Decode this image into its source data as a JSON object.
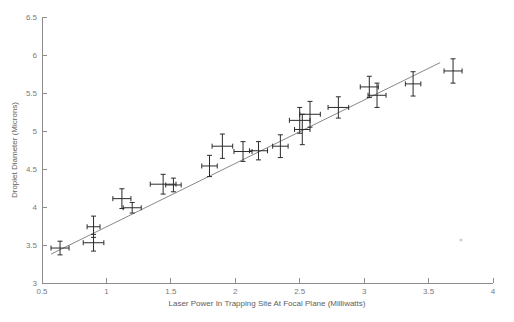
{
  "chart_data": {
    "type": "scatter",
    "title": "",
    "xlabel": "Laser Power In Trapping Site At Focal Plane (Milliwatts)",
    "ylabel": "Droplet Diameter (Microns)",
    "xlim": [
      0.5,
      4.0
    ],
    "ylim": [
      3.0,
      6.5
    ],
    "xticks": [
      0.5,
      1,
      1.5,
      2,
      2.5,
      3,
      3.5,
      4
    ],
    "yticks": [
      3,
      3.5,
      4,
      4.5,
      5,
      5.5,
      6,
      6.5
    ],
    "xtick_labels": [
      "0.5",
      "1",
      "1.5",
      "2",
      "2.5",
      "3",
      "3.5",
      "4"
    ],
    "ytick_labels": [
      "3",
      "3.5",
      "4",
      "4.5",
      "5",
      "5.5",
      "6",
      "6.5"
    ],
    "grid": false,
    "legend": false,
    "error_bars": "both",
    "points": [
      {
        "x": 0.64,
        "y": 3.46,
        "xerr": 0.07,
        "yerr": 0.09
      },
      {
        "x": 0.9,
        "y": 3.74,
        "xerr": 0.05,
        "yerr": 0.14
      },
      {
        "x": 0.9,
        "y": 3.53,
        "xerr": 0.08,
        "yerr": 0.11
      },
      {
        "x": 1.12,
        "y": 4.11,
        "xerr": 0.07,
        "yerr": 0.13
      },
      {
        "x": 1.2,
        "y": 3.99,
        "xerr": 0.07,
        "yerr": 0.07
      },
      {
        "x": 1.44,
        "y": 4.3,
        "xerr": 0.1,
        "yerr": 0.13
      },
      {
        "x": 1.52,
        "y": 4.29,
        "xerr": 0.06,
        "yerr": 0.09
      },
      {
        "x": 1.8,
        "y": 4.54,
        "xerr": 0.06,
        "yerr": 0.14
      },
      {
        "x": 1.9,
        "y": 4.8,
        "xerr": 0.08,
        "yerr": 0.16
      },
      {
        "x": 2.06,
        "y": 4.73,
        "xerr": 0.07,
        "yerr": 0.13
      },
      {
        "x": 2.18,
        "y": 4.74,
        "xerr": 0.07,
        "yerr": 0.12
      },
      {
        "x": 2.35,
        "y": 4.8,
        "xerr": 0.06,
        "yerr": 0.15
      },
      {
        "x": 2.5,
        "y": 5.14,
        "xerr": 0.08,
        "yerr": 0.17
      },
      {
        "x": 2.52,
        "y": 5.02,
        "xerr": 0.06,
        "yerr": 0.2
      },
      {
        "x": 2.58,
        "y": 5.22,
        "xerr": 0.08,
        "yerr": 0.17
      },
      {
        "x": 2.8,
        "y": 5.31,
        "xerr": 0.08,
        "yerr": 0.14
      },
      {
        "x": 3.04,
        "y": 5.58,
        "xerr": 0.07,
        "yerr": 0.14
      },
      {
        "x": 3.1,
        "y": 5.47,
        "xerr": 0.07,
        "yerr": 0.16
      },
      {
        "x": 3.38,
        "y": 5.62,
        "xerr": 0.06,
        "yerr": 0.16
      },
      {
        "x": 3.69,
        "y": 5.79,
        "xerr": 0.07,
        "yerr": 0.16
      }
    ],
    "fit_line": {
      "label": "linear fit",
      "x_start": 0.57,
      "y_start": 3.38,
      "x_end": 3.59,
      "y_end": 5.9
    }
  }
}
